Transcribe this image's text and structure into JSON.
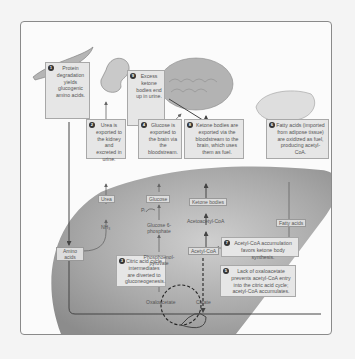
{
  "step_numbers_inferred": true,
  "boxes": {
    "protein": {
      "num": "1",
      "text": "Protein degradation yields glucogenic amino acids."
    },
    "urea": {
      "num": "2",
      "text": "Urea is exported to the kidney and excreted in urine."
    },
    "citric": {
      "num": "3",
      "text": "Citric acid cycle intermediates are diverted to gluconeogenesis."
    },
    "glucose": {
      "num": "4",
      "text": "Glucose is exported to the brain via the bloodstream."
    },
    "lack": {
      "num": "5",
      "text": "Lack of oxaloacetate prevents acetyl-CoA entry into the citric acid cycle; acetyl-CoA accumulates."
    },
    "fatty": {
      "num": "6",
      "text": "Fatty acids (imported from adipose tissue) are oxidized as fuel, producing acetyl-CoA."
    },
    "accum": {
      "num": "7",
      "text": "Acetyl-CoA accumulation favors ketone body synthesis."
    },
    "ketone": {
      "num": "8",
      "text": "Ketone bodies are exported via the bloodstream to the brain, which uses them as fuel."
    },
    "excess": {
      "num": "9",
      "text": "Excess ketone bodies end up in urine."
    }
  },
  "labels": {
    "urea": "Urea",
    "nh3": "NH₃",
    "amino": "Amino acids",
    "glucose": "Glucose",
    "pi": "Pᵢ",
    "g6p": "Glucose 6-phosphate",
    "pep": "Phosphoenol-pyruvate",
    "oaa": "Oxaloacetate",
    "citrate": "Citrate",
    "ketone": "Ketone bodies",
    "acetoacetyl": "Acetoacetyl-CoA",
    "acetyl": "Acetyl-CoA",
    "fatty": "Fatty acids"
  },
  "colors": {
    "liver": "#9a9a9a",
    "box_fill": "#e6e6e6",
    "arrow": "#444444"
  }
}
